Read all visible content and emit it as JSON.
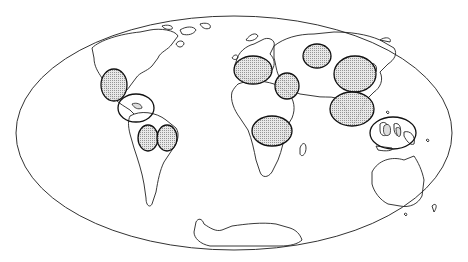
{
  "figure": {
    "type": "world-map",
    "projection": "Mollweide (pseudo-cylindrical ellipse)",
    "outline_color": "#222222",
    "fill_pattern": "stippled",
    "fill_color": "#bdbdbd",
    "background": "#ffffff"
  },
  "highlighted_regions": [
    {
      "id": "central-america-mexico",
      "cx": 114,
      "cy": 85,
      "rx": 13,
      "ry": 16
    },
    {
      "id": "caribbean-northern-south-america",
      "cx": 136,
      "cy": 108,
      "rx": 18,
      "ry": 14
    },
    {
      "id": "andes-amazon-west",
      "cx": 148,
      "cy": 138,
      "rx": 10,
      "ry": 13
    },
    {
      "id": "amazon-east",
      "cx": 167,
      "cy": 138,
      "rx": 10,
      "ry": 13
    },
    {
      "id": "mediterranean-europe",
      "cx": 253,
      "cy": 70,
      "rx": 19,
      "ry": 14
    },
    {
      "id": "middle-east",
      "cx": 287,
      "cy": 86,
      "rx": 12,
      "ry": 13
    },
    {
      "id": "central-africa",
      "cx": 272,
      "cy": 131,
      "rx": 20,
      "ry": 15
    },
    {
      "id": "central-asia",
      "cx": 317,
      "cy": 56,
      "rx": 14,
      "ry": 12
    },
    {
      "id": "china",
      "cx": 355,
      "cy": 74,
      "rx": 21,
      "ry": 18
    },
    {
      "id": "south-asia-india",
      "cx": 352,
      "cy": 109,
      "rx": 22,
      "ry": 17
    },
    {
      "id": "southeast-asia-indonesia",
      "cx": 393,
      "cy": 133,
      "rx": 23,
      "ry": 16
    }
  ]
}
